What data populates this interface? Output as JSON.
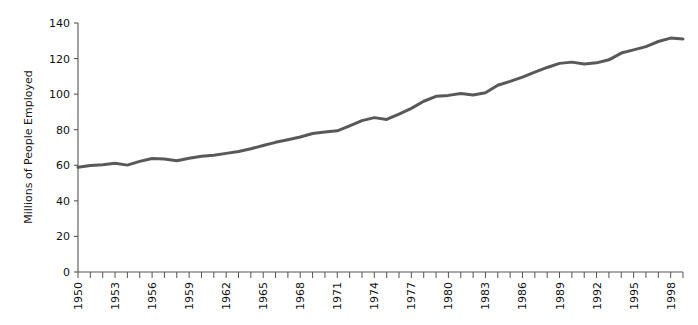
{
  "chart_data": {
    "type": "line",
    "title": "",
    "subtitle": "",
    "xlabel": "",
    "ylabel": "Millions of People Employed",
    "xlim": [
      1950,
      1999
    ],
    "ylim": [
      0,
      140
    ],
    "grid": false,
    "legend": false,
    "legend_position": "none",
    "line_color": "#595959",
    "line_width": 3,
    "y_ticks": [
      0,
      20,
      40,
      60,
      80,
      100,
      120,
      140
    ],
    "y_tick_labels": [
      "0",
      "20",
      "40",
      "60",
      "80",
      "100",
      "120",
      "140"
    ],
    "x_tick_labels": [
      "1950",
      "1953",
      "1956",
      "1959",
      "1962",
      "1965",
      "1968",
      "1971",
      "1974",
      "1977",
      "1980",
      "1983",
      "1986",
      "1989",
      "1992",
      "1995",
      "1998"
    ],
    "x_tick_label_values": [
      1950,
      1953,
      1956,
      1959,
      1962,
      1965,
      1968,
      1971,
      1974,
      1977,
      1980,
      1983,
      1986,
      1989,
      1992,
      1995,
      1998
    ],
    "x_minor_tick_interval": 1,
    "x_label_rotation": 90,
    "series": [
      {
        "name": "Millions of People Employed",
        "color": "#595959",
        "x": [
          1950,
          1951,
          1952,
          1953,
          1954,
          1955,
          1956,
          1957,
          1958,
          1959,
          1960,
          1961,
          1962,
          1963,
          1964,
          1965,
          1966,
          1967,
          1968,
          1969,
          1970,
          1971,
          1972,
          1973,
          1974,
          1975,
          1976,
          1977,
          1978,
          1979,
          1980,
          1981,
          1982,
          1983,
          1984,
          1985,
          1986,
          1987,
          1988,
          1989,
          1990,
          1991,
          1992,
          1993,
          1994,
          1995,
          1996,
          1997,
          1998,
          1999
        ],
        "values": [
          58.9,
          59.9,
          60.3,
          61.2,
          60.1,
          62.2,
          63.8,
          63.5,
          62.6,
          64.0,
          65.1,
          65.7,
          66.7,
          67.8,
          69.3,
          71.1,
          72.9,
          74.4,
          75.9,
          77.9,
          78.7,
          79.4,
          82.2,
          85.1,
          86.8,
          85.8,
          88.8,
          92.0,
          96.0,
          98.8,
          99.3,
          100.4,
          99.5,
          100.8,
          105.0,
          107.2,
          109.6,
          112.4,
          115.0,
          117.3,
          118.0,
          117.0,
          117.6,
          119.3,
          123.1,
          124.9,
          126.7,
          129.6,
          131.5,
          131.0
        ]
      }
    ],
    "annotations": []
  },
  "axis": {
    "y_label": "Millions of People Employed",
    "axis_color": "#555555",
    "tick_color": "#555555",
    "text_color": "#111111"
  }
}
